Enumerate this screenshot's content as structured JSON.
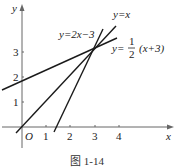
{
  "figure": {
    "caption": "图 1-14",
    "axes": {
      "x_label": "x",
      "y_label": "y",
      "origin_label": "O",
      "x_ticks": [
        "1",
        "2",
        "3",
        "4"
      ],
      "y_ticks": [
        "1",
        "2",
        "3"
      ]
    },
    "lines": [
      {
        "label_prefix": "y=",
        "label_expr": "x",
        "equation": "y = x"
      },
      {
        "label_prefix": "y=",
        "label_expr": "2x−3",
        "equation": "y = 2x − 3"
      },
      {
        "label_prefix": "y=",
        "label_frac_num": "1",
        "label_frac_den": "2",
        "label_expr": "(x+3)",
        "equation": "y = 1/2 (x + 3)"
      }
    ],
    "intersection": {
      "x": 3,
      "y": 3
    },
    "colors": {
      "line": "#1a1a1a",
      "axis": "#555555"
    }
  }
}
